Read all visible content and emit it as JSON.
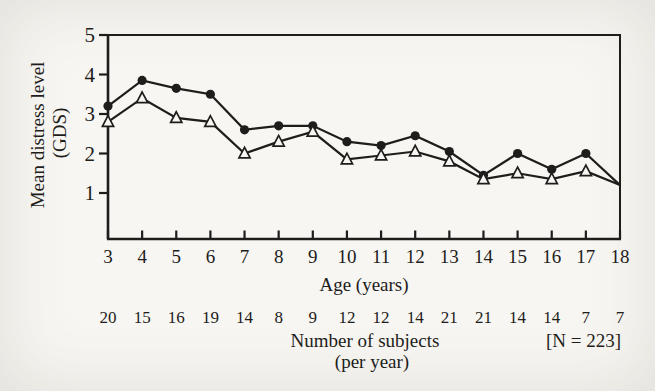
{
  "colors": {
    "ink": "#1e1d1b",
    "paper": "#f7f6f2"
  },
  "chart_data": {
    "type": "line",
    "x": [
      3,
      4,
      5,
      6,
      7,
      8,
      9,
      10,
      11,
      12,
      13,
      14,
      15,
      16,
      17,
      18
    ],
    "series": [
      {
        "name": "upper-series-filled-circles",
        "marker": "circle",
        "values": [
          3.2,
          3.85,
          3.65,
          3.5,
          2.6,
          2.7,
          2.7,
          2.3,
          2.2,
          2.45,
          2.05,
          1.45,
          2.0,
          1.6,
          2.0,
          1.2
        ]
      },
      {
        "name": "lower-series-open-triangles",
        "marker": "triangle",
        "values": [
          2.8,
          3.4,
          2.9,
          2.8,
          2.0,
          2.3,
          2.55,
          1.85,
          1.95,
          2.05,
          1.8,
          1.35,
          1.5,
          1.35,
          1.55,
          1.2
        ]
      }
    ],
    "marker_on_last_point": false,
    "title": "",
    "xlabel": "Age (years)",
    "ylabel_lines": [
      "Mean distress level",
      "(GDS)"
    ],
    "ylim": [
      1,
      5
    ],
    "yticks": [
      1,
      2,
      3,
      4,
      5
    ],
    "xticks": [
      3,
      4,
      5,
      6,
      7,
      8,
      9,
      10,
      11,
      12,
      13,
      14,
      15,
      16,
      17,
      18
    ],
    "grid": false,
    "legend": "none",
    "frame": "full-box",
    "subjects_per_year": [
      20,
      15,
      16,
      19,
      14,
      8,
      9,
      12,
      12,
      14,
      21,
      21,
      14,
      14,
      7,
      7
    ],
    "subjects_caption_lines": [
      "Number of subjects",
      "(per year)"
    ],
    "n_total": 223,
    "n_total_label": "[N = 223]"
  }
}
